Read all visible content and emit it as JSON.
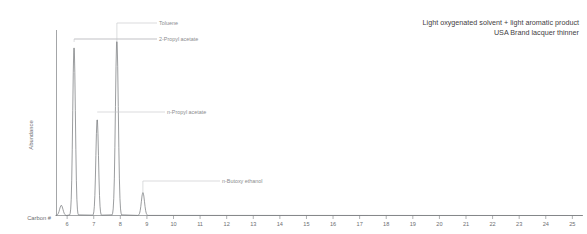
{
  "caption": {
    "line1": "Light oxygenated solvent + light aromatic product",
    "line2": "USA Brand lacquer thinner"
  },
  "chart_data": {
    "type": "line",
    "title": "",
    "subtitle": "",
    "xlabel": "Carbon #",
    "ylabel": "Abundance",
    "xlim": [
      5.6,
      25.4
    ],
    "ylim": [
      0,
      100
    ],
    "grid": false,
    "legend_position": "none",
    "xticks": [
      6,
      7,
      8,
      9,
      10,
      11,
      12,
      13,
      14,
      15,
      16,
      17,
      18,
      19,
      20,
      21,
      22,
      23,
      24,
      25
    ],
    "xticklabels": [
      "6",
      "7",
      "8",
      "9",
      "10",
      "11",
      "12",
      "13",
      "14",
      "15",
      "16",
      "17",
      "18",
      "19",
      "20",
      "21",
      "22",
      "23",
      "24",
      "25"
    ],
    "yticks": [],
    "yticklabels": [],
    "series": [
      {
        "name": "Total ion chromatogram",
        "color": "#7a7c7f",
        "peaks": [
          {
            "carbon": 5.78,
            "height": 5.5,
            "width": 0.07,
            "label": ""
          },
          {
            "carbon": 6.26,
            "height": 92.0,
            "width": 0.055,
            "label": "2-Propyl acetate"
          },
          {
            "carbon": 7.13,
            "height": 52.5,
            "width": 0.055,
            "label": "n-Propyl acetate"
          },
          {
            "carbon": 7.87,
            "height": 95.5,
            "width": 0.06,
            "label": "Toluene"
          },
          {
            "carbon": 8.85,
            "height": 12.5,
            "width": 0.065,
            "label": "n-Butoxy ethanol"
          }
        ]
      }
    ],
    "annotations": [
      {
        "text": "Toluene",
        "target_carbon": 7.87,
        "label_x": 159,
        "label_y": 23
      },
      {
        "text": "2-Propyl acetate",
        "target_carbon": 6.26,
        "label_x": 159,
        "label_y": 39
      },
      {
        "text": "n-Propyl acetate",
        "target_carbon": 7.13,
        "label_x": 167,
        "label_y": 112
      },
      {
        "text": "n-Butoxy ethanol",
        "target_carbon": 8.85,
        "label_x": 222,
        "label_y": 181
      }
    ]
  }
}
